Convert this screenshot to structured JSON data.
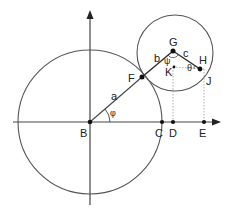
{
  "diagram": {
    "points": {
      "B": "B",
      "C": "C",
      "D": "D",
      "E": "E",
      "F": "F",
      "G": "G",
      "H": "H",
      "J": "J",
      "K": "K"
    },
    "segments": {
      "a": "a",
      "b": "b",
      "c": "c"
    },
    "angles": {
      "phi": "φ",
      "psi": "ψ",
      "theta": "θ"
    },
    "colors": {
      "stroke": "#444444",
      "dotted": "#888888",
      "point": "#111111"
    }
  }
}
